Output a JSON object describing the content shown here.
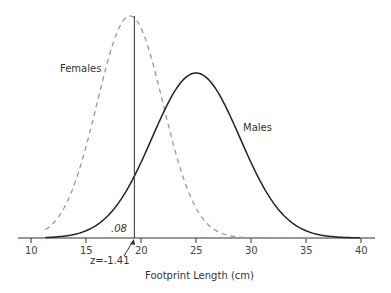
{
  "chart_data": {
    "type": "line",
    "title": "",
    "xlabel": "Footprint Length (cm)",
    "ylabel": "",
    "xlim": [
      10,
      40
    ],
    "x_ticks": [
      10,
      15,
      20,
      25,
      30,
      35,
      40
    ],
    "grid": false,
    "legend": "none (inline curve labels)",
    "series": [
      {
        "name": "Females",
        "distribution": "normal",
        "mean": 19.0,
        "sd": 3.0,
        "line_style": "dashed",
        "color": "#999999"
      },
      {
        "name": "Males",
        "distribution": "normal",
        "mean": 25.0,
        "sd": 4.0,
        "line_style": "solid",
        "color": "#222222"
      }
    ],
    "annotations": [
      {
        "type": "vertical_line",
        "x": 19.4
      },
      {
        "type": "text",
        "text": ".08",
        "note": "shaded tail area left of cutoff under Males curve"
      },
      {
        "type": "arrow_label",
        "text": "z=-1.41",
        "x": 19.4
      }
    ]
  },
  "labels": {
    "females": "Females",
    "males": "Males",
    "area": ".08",
    "z": "z=-1.41",
    "xlabel": "Footprint Length (cm)",
    "ticks": [
      "10",
      "15",
      "20",
      "25",
      "30",
      "35",
      "40"
    ]
  }
}
